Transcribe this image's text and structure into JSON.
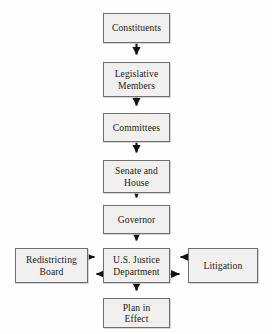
{
  "diagram": {
    "type": "flowchart",
    "background_color": "#fefefe",
    "node_fill_color": "#f1f0ef",
    "node_border_color": "#6e6e6e",
    "edge_color": "#111111",
    "nodes": [
      {
        "id": "constituents",
        "label": "Constituents",
        "x": 103,
        "y": 13,
        "w": 67,
        "h": 30
      },
      {
        "id": "legislative-members",
        "label": "Legislative\nMembers",
        "line1": "Legislative",
        "line2": "Members",
        "x": 103,
        "y": 62,
        "w": 67,
        "h": 35
      },
      {
        "id": "committees",
        "label": "Committees",
        "x": 103,
        "y": 113,
        "w": 67,
        "h": 29
      },
      {
        "id": "senate-and-house",
        "label": "Senate and\nHouse",
        "line1": "Senate and",
        "line2": "House",
        "x": 103,
        "y": 160,
        "w": 67,
        "h": 33
      },
      {
        "id": "governor",
        "label": "Governor",
        "x": 103,
        "y": 205,
        "w": 67,
        "h": 29
      },
      {
        "id": "redistricting-board",
        "label": "Redistricting\nBoard",
        "line1": "Redistricting",
        "line2": "Board",
        "x": 15,
        "y": 248,
        "w": 73,
        "h": 35
      },
      {
        "id": "us-justice-department",
        "label": "U.S. Justice\nDepartment",
        "line1": "U.S. Justice",
        "line2": "Department",
        "x": 103,
        "y": 248,
        "w": 67,
        "h": 35
      },
      {
        "id": "litigation",
        "label": "Litigation",
        "x": 188,
        "y": 248,
        "w": 70,
        "h": 35
      },
      {
        "id": "plan-in-effect",
        "label": "Plan in\nEffect",
        "line1": "Plan in",
        "line2": "Effect",
        "x": 103,
        "y": 298,
        "w": 67,
        "h": 30
      }
    ],
    "edges": [
      {
        "from": "constituents",
        "to": "legislative-members",
        "direction": "down"
      },
      {
        "from": "legislative-members",
        "to": "committees",
        "direction": "down"
      },
      {
        "from": "committees",
        "to": "senate-and-house",
        "direction": "down"
      },
      {
        "from": "senate-and-house",
        "to": "governor",
        "direction": "down"
      },
      {
        "from": "governor",
        "to": "us-justice-department",
        "direction": "down"
      },
      {
        "from": "redistricting-board",
        "to": "us-justice-department",
        "direction": "right"
      },
      {
        "from": "us-justice-department",
        "to": "redistricting-board",
        "direction": "left"
      },
      {
        "from": "litigation",
        "to": "us-justice-department",
        "direction": "left"
      },
      {
        "from": "us-justice-department",
        "to": "litigation",
        "direction": "right"
      },
      {
        "from": "us-justice-department",
        "to": "plan-in-effect",
        "direction": "down"
      }
    ]
  }
}
